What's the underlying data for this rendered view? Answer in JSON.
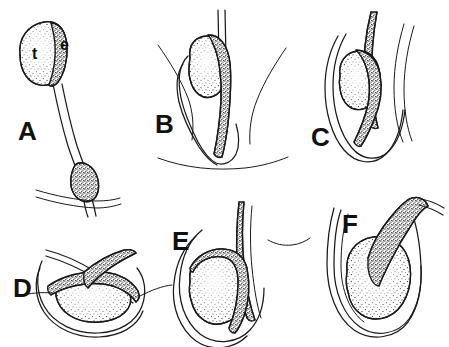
{
  "figure": {
    "background_color": "#ffffff",
    "ink_color": "#1a1a1a",
    "width": 449,
    "height": 347,
    "style": "pen-and-ink line drawing with stipple shading"
  },
  "labels": {
    "testis": "t",
    "epididymis": "e"
  },
  "panels": [
    {
      "letter": "A",
      "name": "panel-a",
      "x": 18,
      "y": 140,
      "caption": "Abdominal testis with elongated gubernaculum",
      "structures": [
        "testis",
        "epididymis",
        "gubernaculum",
        "abdominal wall"
      ]
    },
    {
      "letter": "B",
      "name": "panel-b",
      "x": 155,
      "y": 133,
      "caption": "Testis at inguinal region, gubernaculum entering scrotum",
      "structures": [
        "testis",
        "epididymis",
        "vas deferens",
        "scrotal wall"
      ]
    },
    {
      "letter": "C",
      "name": "panel-c",
      "x": 311,
      "y": 146,
      "caption": "Testis within processus vaginalis",
      "structures": [
        "testis",
        "epididymis",
        "spermatic cord",
        "processus vaginalis"
      ]
    },
    {
      "letter": "D",
      "name": "panel-d",
      "x": 13,
      "y": 297,
      "caption": "Testis horizontal within scrotal sac",
      "structures": [
        "testis",
        "epididymis",
        "vas deferens",
        "tunica vaginalis"
      ]
    },
    {
      "letter": "E",
      "name": "panel-e",
      "x": 172,
      "y": 250,
      "caption": "Testis vertical in scrotum with epididymis along posterior border",
      "structures": [
        "testis",
        "epididymis",
        "spermatic cord",
        "tunica vaginalis"
      ]
    },
    {
      "letter": "F",
      "name": "panel-f",
      "x": 342,
      "y": 233,
      "caption": "Descended testis with epididymis superior and vas deferens ascending",
      "structures": [
        "testis",
        "epididymis",
        "vas deferens",
        "tunica vaginalis"
      ]
    }
  ]
}
